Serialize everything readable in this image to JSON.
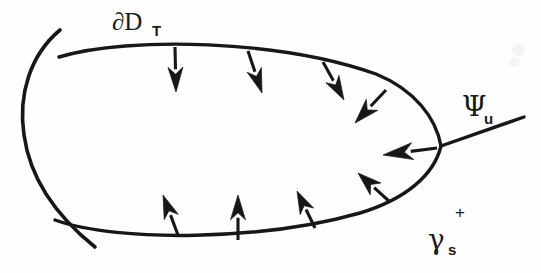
{
  "figure": {
    "background_color": "#fefefe",
    "ink_color": "#171717",
    "width": 541,
    "height": 273
  },
  "labels": {
    "boundary": {
      "name": "partial-D-T",
      "base": "∂D",
      "subscript": "T",
      "x": 112,
      "y": 30,
      "text": "∂D_T"
    },
    "unstable": {
      "name": "psi-u",
      "base": "Ψ",
      "subscript": "u",
      "x": 462,
      "y": 116,
      "text": "Ψ_u"
    },
    "stable": {
      "name": "gamma-s-plus",
      "base": "γ",
      "subscript": "s",
      "superscript": "+",
      "x": 430,
      "y": 244,
      "text": "γ_s^+"
    }
  },
  "curves": {
    "outer_arc": {
      "name": "partial-D-T-arc",
      "description": "large circular arc bulging leftward, passing through both branch nodes",
      "path": "M 60 30 C 30 55 18 95 24 135 C 30 178 55 215 95 247"
    },
    "lens_top": {
      "name": "gamma-s-upper-branch",
      "description": "upper boundary of the lens region from left node to right node",
      "path": "M 59 57 C 130 36 280 40 376 74 C 415 90 436 118 441 146"
    },
    "lens_bottom": {
      "name": "gamma-s-lower-branch",
      "description": "lower boundary of the lens region from left node to right node",
      "path": "M 55 220 C 120 243 265 240 360 213 C 406 199 434 175 441 146"
    },
    "psi_u_line": {
      "name": "psi-u-ray",
      "description": "straight ray from right node toward upper right",
      "path": "M 441 146 L 524 117"
    }
  },
  "nodes": [
    {
      "name": "left-upper-node",
      "x": 59,
      "y": 57
    },
    {
      "name": "left-lower-node",
      "x": 55,
      "y": 220
    },
    {
      "name": "right-node",
      "x": 441,
      "y": 146
    }
  ],
  "arrows": [
    {
      "name": "arrow-top-1",
      "tail_x": 175,
      "tail_y": 47,
      "tip_x": 176,
      "tip_y": 92,
      "width": 15
    },
    {
      "name": "arrow-top-2",
      "tail_x": 248,
      "tail_y": 51,
      "tip_x": 262,
      "tip_y": 93,
      "width": 15
    },
    {
      "name": "arrow-top-3",
      "tail_x": 323,
      "tail_y": 62,
      "tip_x": 344,
      "tip_y": 100,
      "width": 15
    },
    {
      "name": "arrow-top-4",
      "tail_x": 386,
      "tail_y": 90,
      "tip_x": 355,
      "tip_y": 123,
      "width": 16
    },
    {
      "name": "arrow-right",
      "tail_x": 437,
      "tail_y": 148,
      "tip_x": 383,
      "tip_y": 155,
      "width": 17
    },
    {
      "name": "arrow-bottom-4",
      "tail_x": 390,
      "tail_y": 202,
      "tip_x": 358,
      "tip_y": 173,
      "width": 16
    },
    {
      "name": "arrow-bottom-3",
      "tail_x": 315,
      "tail_y": 228,
      "tip_x": 297,
      "tip_y": 191,
      "width": 15
    },
    {
      "name": "arrow-bottom-2",
      "tail_x": 238,
      "tail_y": 240,
      "tip_x": 238,
      "tip_y": 195,
      "width": 15
    },
    {
      "name": "arrow-bottom-1",
      "tail_x": 178,
      "tail_y": 235,
      "tip_x": 163,
      "tip_y": 195,
      "width": 15
    }
  ],
  "stroke_widths": {
    "outer_arc": 3.6,
    "lens": 3.4,
    "psi_ray": 3.4
  }
}
